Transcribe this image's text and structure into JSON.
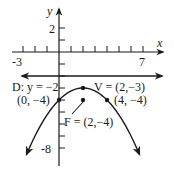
{
  "graph": {
    "axes": {
      "x_label": "x",
      "y_label": "y",
      "x_tick_min": -3,
      "x_tick_max": 7,
      "y_tick_min": -8,
      "y_tick_max": 2,
      "x_tick_labels": [
        "-3",
        "7"
      ],
      "y_tick_labels": [
        "2",
        "-8"
      ]
    },
    "directrix": {
      "label": "D: y = −2",
      "y": -2
    },
    "vertex": {
      "label": "V = (2,−3)",
      "x": 2,
      "y": -3
    },
    "focus": {
      "label": "F = (2,−4)",
      "x": 2,
      "y": -4
    },
    "points": [
      {
        "label": "(0, −4)",
        "x": 0,
        "y": -4
      },
      {
        "label": "(4, −4)",
        "x": 4,
        "y": -4
      }
    ],
    "curve": {
      "equation": "(x-2)^2 = -4(y+3)",
      "x_from": -2.7,
      "x_to": 6.7
    },
    "colors": {
      "ink": "#1a1a1a",
      "background": "#ffffff"
    }
  }
}
